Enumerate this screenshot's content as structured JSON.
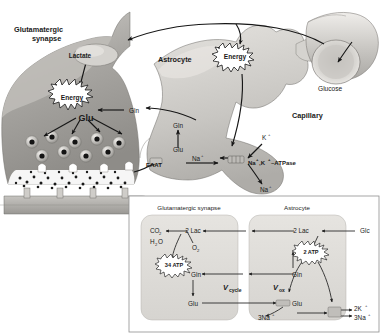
{
  "figure": {
    "title_hidden": "Astrocyte-neuron lactate shuttle and glutamate-glutamine cycle"
  },
  "main_panel": {
    "labels": {
      "synapse": "Glutamatergic",
      "synapse2": "synapse",
      "astrocyte": "Astrocyte",
      "capillary": "Capillary",
      "glucose": "Glucose",
      "lactate": "Lactate",
      "energy_neuron": "Energy",
      "energy_astro": "Energy",
      "glu_presyn": "Glu",
      "gln_presyn": "Gln",
      "gln_astro": "Gln",
      "glu_astro": "Glu",
      "eaat": "EAAT",
      "na_in": "Na",
      "na_in_sup": "+",
      "k_out": "K",
      "k_out_sup": "+",
      "na_out": "Na",
      "na_out_sup": "+",
      "pump": "Na",
      "pump_sup1": "+",
      "pump_mid": ",K",
      "pump_sup2": "+",
      "pump_end": "–ATPase"
    }
  },
  "inset_panel": {
    "headers": {
      "left": "Glutamatergic synapse",
      "right": "Astrocyte"
    },
    "labels": {
      "co2": "CO",
      "co2_sub": "2",
      "h2o": "H",
      "h2o_sub": "2",
      "h2o_end": "O",
      "lac_neuron": "2 Lac",
      "lac_astro": "2 Lac",
      "glc": "Glc",
      "o2": "O",
      "o2_sub": "2",
      "atp34": "34 ATP",
      "atp2": "2 ATP",
      "gln_neuron": "Gln",
      "gln_astro": "Gln",
      "glu_neuron": "Glu",
      "glu_astro": "Glu",
      "vcycle": "V",
      "vcycle_sub": "cycle",
      "vox": "V",
      "vox_sub": "ox",
      "na3_in": "3Na",
      "na3_in_sup": "+",
      "k2": "2K",
      "k2_sup": "+",
      "na3": "3Na",
      "na3_sup": "+"
    }
  },
  "colors": {
    "ink": "#1a1a1a",
    "cell_fill": "#d8d6d2",
    "cell_fill_dark": "#b9b7b3",
    "inset_border": "#9a9a9a",
    "inset_cell": "#dedcd8",
    "white": "#ffffff"
  }
}
